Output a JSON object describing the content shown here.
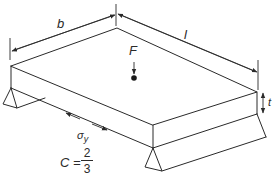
{
  "diagram": {
    "type": "isometric plate on two supports with central point load",
    "labels": {
      "width": "b",
      "length": "l",
      "force": "F",
      "thickness": "t",
      "stress_symbol": "σ",
      "stress_subscript": "y",
      "constant_lhs": "C =",
      "constant_numerator": "2",
      "constant_denominator": "3"
    },
    "colors": {
      "line": "#2a2a2a",
      "background": "#ffffff"
    }
  }
}
